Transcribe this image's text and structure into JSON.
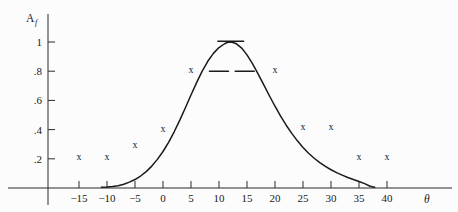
{
  "chart_data": {
    "type": "line",
    "title": "",
    "subtitle": "",
    "xlabel": "θ",
    "ylabel": "A",
    "ylabel_sub": "f",
    "xlim": [
      -18,
      47
    ],
    "ylim": [
      0,
      1.12
    ],
    "grid": false,
    "legend": "none",
    "xticks": [
      -15,
      -10,
      -5,
      0,
      5,
      10,
      15,
      20,
      25,
      30,
      35,
      40
    ],
    "xtick_labels": [
      "−15",
      "−10",
      "−5",
      "0",
      "5",
      "10",
      "15",
      "20",
      "25",
      "30",
      "35",
      "40"
    ],
    "yticks": [
      0.2,
      0.4,
      0.6,
      0.8,
      1.0
    ],
    "ytick_labels": [
      ".2",
      ".4",
      ".6",
      ".8",
      "1"
    ],
    "series": [
      {
        "name": "fitted curve",
        "type": "line",
        "color": "#1a1a1a",
        "points": [
          [
            -11.0,
            0.005
          ],
          [
            -10.0,
            0.006
          ],
          [
            -9.0,
            0.01
          ],
          [
            -8.0,
            0.016
          ],
          [
            -7.0,
            0.026
          ],
          [
            -6.0,
            0.04
          ],
          [
            -5.0,
            0.058
          ],
          [
            -4.0,
            0.082
          ],
          [
            -3.0,
            0.112
          ],
          [
            -2.0,
            0.15
          ],
          [
            -1.0,
            0.196
          ],
          [
            0.0,
            0.25
          ],
          [
            1.0,
            0.313
          ],
          [
            2.0,
            0.385
          ],
          [
            3.0,
            0.465
          ],
          [
            4.0,
            0.55
          ],
          [
            5.0,
            0.637
          ],
          [
            6.0,
            0.722
          ],
          [
            7.0,
            0.8
          ],
          [
            8.0,
            0.868
          ],
          [
            9.0,
            0.922
          ],
          [
            10.0,
            0.962
          ],
          [
            11.0,
            0.988
          ],
          [
            11.6,
            0.998
          ],
          [
            12.2,
            1.0
          ],
          [
            13.0,
            0.99
          ],
          [
            14.0,
            0.96
          ],
          [
            15.0,
            0.912
          ],
          [
            16.0,
            0.85
          ],
          [
            17.0,
            0.78
          ],
          [
            18.0,
            0.706
          ],
          [
            19.0,
            0.632
          ],
          [
            20.0,
            0.56
          ],
          [
            21.0,
            0.492
          ],
          [
            22.0,
            0.43
          ],
          [
            23.0,
            0.374
          ],
          [
            24.0,
            0.323
          ],
          [
            25.0,
            0.278
          ],
          [
            26.0,
            0.238
          ],
          [
            27.0,
            0.204
          ],
          [
            28.0,
            0.174
          ],
          [
            29.0,
            0.148
          ],
          [
            30.0,
            0.125
          ],
          [
            31.0,
            0.105
          ],
          [
            32.0,
            0.088
          ],
          [
            33.0,
            0.072
          ],
          [
            34.0,
            0.058
          ],
          [
            35.0,
            0.045
          ],
          [
            36.0,
            0.03
          ],
          [
            37.0,
            0.012
          ],
          [
            37.8,
            0.005
          ]
        ]
      },
      {
        "name": "measured data",
        "type": "scatter",
        "marker": "x",
        "color": "#1a1a1a",
        "points": [
          [
            -15,
            0.205
          ],
          [
            -10,
            0.205
          ],
          [
            -5,
            0.293
          ],
          [
            0,
            0.4
          ],
          [
            5,
            0.8
          ],
          [
            20,
            0.8
          ],
          [
            25,
            0.41
          ],
          [
            30,
            0.415
          ],
          [
            35,
            0.205
          ],
          [
            40,
            0.205
          ]
        ]
      }
    ],
    "error_bars": [
      {
        "name": "peak-error-bar",
        "theta": 12.1,
        "value": 1.005,
        "half_width": 2.3
      },
      {
        "name": "left-flank-error-bar",
        "theta": 10.0,
        "value": 0.8,
        "half_width": 1.7
      },
      {
        "name": "right-flank-error-bar",
        "theta": 14.6,
        "value": 0.8,
        "half_width": 1.7
      }
    ]
  }
}
